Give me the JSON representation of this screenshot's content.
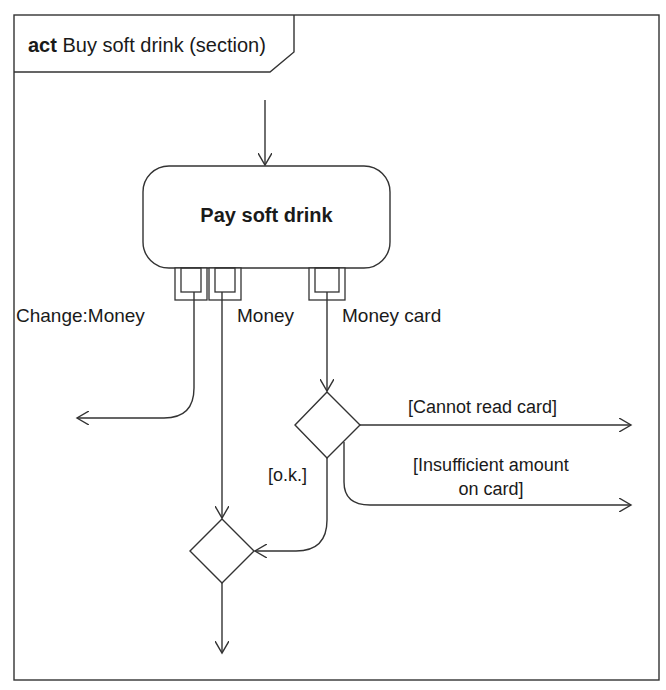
{
  "frame": {
    "keyword": "act",
    "title": "Buy soft drink (section)"
  },
  "action": {
    "name": "Pay soft drink"
  },
  "pins": [
    {
      "label": "Change:Money",
      "direction": "output"
    },
    {
      "label": "Money",
      "direction": "output"
    },
    {
      "label": "Money card",
      "direction": "output"
    }
  ],
  "decision": {
    "guards": {
      "cannot_read": "[Cannot read card]",
      "insufficient_line1": "[Insufficient amount",
      "insufficient_line2": "on card]",
      "ok": "[o.k.]"
    }
  },
  "colors": {
    "stroke": "#333333",
    "background": "#ffffff",
    "text": "#1a1a1a"
  }
}
